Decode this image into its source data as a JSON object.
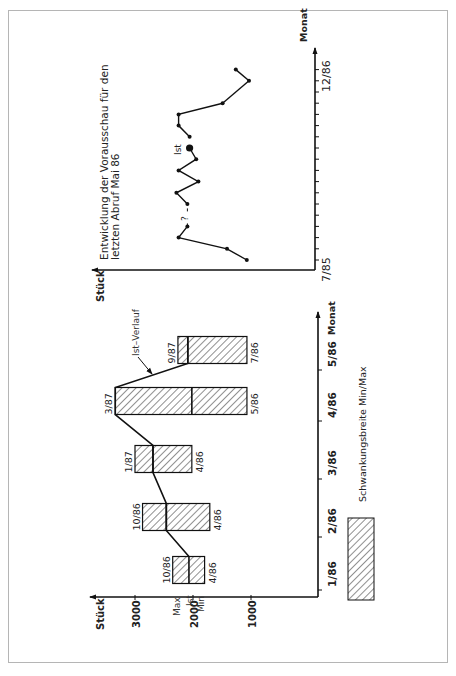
{
  "colors": {
    "ink": "#111111",
    "frame": "#b5b5b5",
    "hatch": "#222222"
  },
  "chart_data": [
    {
      "type": "bar",
      "subtype": "range-bar (floating min/max boxes with actual value line)",
      "orientation": "rotated 90° counter-clockwise on page",
      "ylabel": "Stück",
      "ylabel_text": "Stück",
      "xlabel": "Monat",
      "y_ticks": [
        "3000",
        "2000",
        "1000"
      ],
      "y_tick_values": [
        3000,
        2000,
        1000
      ],
      "ylim": [
        700,
        3600
      ],
      "categories": [
        "1/86",
        "2/86",
        "3/86",
        "4/86",
        "5/86"
      ],
      "series": [
        {
          "name": "Max",
          "values": [
            2350,
            2870,
            3000,
            3340,
            2260
          ]
        },
        {
          "name": "Min",
          "values": [
            1800,
            1710,
            2020,
            1070,
            1070
          ]
        },
        {
          "name": "Ist",
          "values": [
            2070,
            2460,
            2690,
            2020,
            2090
          ]
        }
      ],
      "ist_verlauf_peak": {
        "category": "4/86",
        "value": 3340
      },
      "max_labels": [
        "10/86",
        "10/86",
        "1/87",
        "3/87",
        "9/87"
      ],
      "min_labels": [
        "4/86",
        "4/86",
        "4/86",
        "5/86",
        "7/86"
      ],
      "annotations": {
        "max": "Max",
        "ist": "Ist",
        "min": "Min",
        "ist_verlauf": "Ist–Verlauf"
      },
      "legend": {
        "label": "Schwankungsbreite  Min/Max",
        "position": "bottom-right (rotated page)"
      }
    },
    {
      "type": "line",
      "orientation": "rotated 90° counter-clockwise on page",
      "title": "Entwicklung der Vorausschau für den letzten Abruf Mai 86",
      "title_lines": [
        "Entwicklung der Vorausschau für den",
        "letzten Abruf Mai 86"
      ],
      "ylabel": "Stück",
      "xlabel": "Monat",
      "x_tick_labels": [
        "7/85",
        "12/86"
      ],
      "x": [
        "7/85",
        "8/85",
        "9/85",
        "10/85",
        "11/85",
        "12/85",
        "1/86",
        "2/86",
        "3/86",
        "4/86",
        "5/86",
        "6/86",
        "7/86",
        "8/86",
        "9/86",
        "10/86",
        "11/86",
        "12/86"
      ],
      "y_note": "unlabeled stock axis; values are relative levels (0 = axis, 1 = top of axis)",
      "values": [
        0.31,
        0.4,
        0.62,
        0.58,
        null,
        0.58,
        0.63,
        0.53,
        0.62,
        0.54,
        0.57,
        0.57,
        0.62,
        0.62,
        0.42,
        null,
        0.3,
        0.36
      ],
      "segments": [
        [
          0,
          3
        ],
        [
          5,
          10
        ],
        [
          11,
          14
        ],
        [
          14,
          16
        ],
        [
          16,
          17
        ]
      ],
      "gap_markers": [
        {
          "at": "11/85",
          "label": "?"
        }
      ],
      "highlight": {
        "at": "5/86",
        "label": "Ist"
      }
    }
  ]
}
